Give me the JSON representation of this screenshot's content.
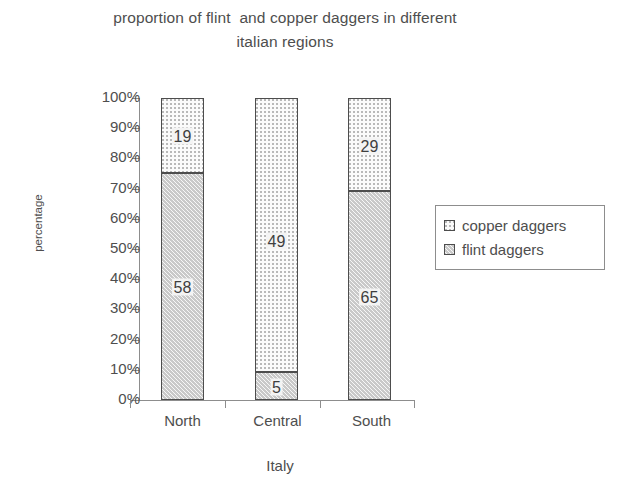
{
  "chart_data": {
    "type": "bar",
    "subtype": "stacked-100-percent",
    "title": "proportion of flint  and copper daggers in different\nitalian regions",
    "xlabel": "Italy",
    "ylabel": "percentage",
    "categories": [
      "North",
      "Central",
      "South"
    ],
    "series": [
      {
        "name": "copper daggers",
        "values": [
          19,
          49,
          29
        ],
        "percents": [
          24.7,
          90.7,
          30.9
        ],
        "swatch": "light-dotted"
      },
      {
        "name": "flint daggers",
        "values": [
          58,
          5,
          65
        ],
        "percents": [
          75.3,
          9.3,
          69.1
        ],
        "swatch": "grey-hatched"
      }
    ],
    "ytick_labels": [
      "100%",
      "90%",
      "80%",
      "70%",
      "60%",
      "50%",
      "40%",
      "30%",
      "20%",
      "10%",
      "0%"
    ],
    "ylim": [
      0,
      100
    ],
    "grid": false,
    "legend_position": "right",
    "colors": {
      "copper_fill": "#fbfbfb",
      "flint_fill": "#c9c9c9",
      "outline": "#4d4d4d",
      "axis": "#8d8d8d",
      "text": "#4e4e4e",
      "background": "#ffffff"
    }
  },
  "legend": {
    "items": [
      {
        "label": "copper daggers"
      },
      {
        "label": "flint daggers"
      }
    ]
  }
}
